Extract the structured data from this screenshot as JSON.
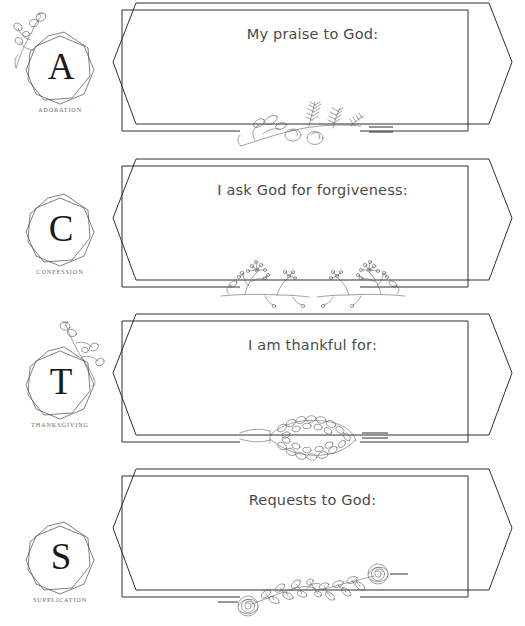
{
  "document": {
    "title": "ACTS Prayer Journal Worksheet",
    "background_color": "#ffffff",
    "ink_color": "#2e2e2e",
    "caption_color": "#6d6a68",
    "heading_color": "#4a4a4a"
  },
  "sections": [
    {
      "letter": "A",
      "caption": "ADORATION",
      "prompt": "My praise to God:",
      "floral": "sweet-pea-wheat-sprig",
      "badge_sprig": "left-poppy-sprig"
    },
    {
      "letter": "C",
      "caption": "CONFESSION",
      "prompt": "I ask God for forgiveness:",
      "floral": "mirrored-babys-breath-sprig",
      "badge_sprig": "none"
    },
    {
      "letter": "T",
      "caption": "THANKSGIVING",
      "prompt": "I am thankful for:",
      "floral": "eucalyptus-laurel-sprig",
      "badge_sprig": "right-poppy-sprig"
    },
    {
      "letter": "S",
      "caption": "SUPPLICATION",
      "prompt": "Requests to God:",
      "floral": "rose-vine-sprig",
      "badge_sprig": "none"
    }
  ]
}
